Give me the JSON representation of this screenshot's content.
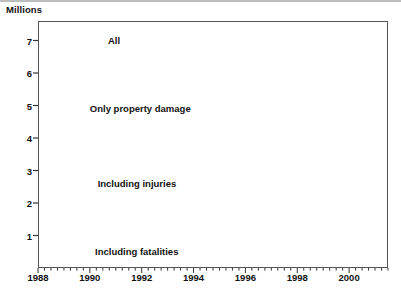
{
  "figure": {
    "units_label": "Millions"
  },
  "chart_data": {
    "type": "line",
    "title": "",
    "subtitle": "",
    "xlabel": "",
    "ylabel": "Millions",
    "ylim": [
      0,
      7.6
    ],
    "xlim": [
      1988,
      2001.5
    ],
    "grid": false,
    "legend_position": "inline-annotations",
    "y_ticks": [
      1,
      2,
      3,
      4,
      5,
      6,
      7
    ],
    "y_tick_labels": [
      "1",
      "2",
      "3",
      "4",
      "5",
      "6",
      "7"
    ],
    "x_ticks": [
      1988,
      1990,
      1992,
      1994,
      1996,
      1998,
      2000
    ],
    "x_tick_labels": [
      "1988",
      "1990",
      "1992",
      "1994",
      "1996",
      "1998",
      "2000"
    ],
    "x_minor_tick_interval": 0.25,
    "x": [
      1988,
      1989,
      1990,
      1991,
      1992,
      1993,
      1994,
      1995,
      1996,
      1997,
      1998,
      1999,
      2000,
      2001
    ],
    "series": [
      {
        "name": "All",
        "label": "All",
        "style": "solid",
        "color": "#1a1a1a",
        "values": [
          6.89,
          6.66,
          6.47,
          6.12,
          6.0,
          6.11,
          6.5,
          6.7,
          6.77,
          6.62,
          6.33,
          6.28,
          6.39,
          6.32
        ]
      },
      {
        "name": "Only property damage",
        "label": "Only property damage",
        "style": "dashed",
        "color": "#1a1a1a",
        "values": [
          4.6,
          4.45,
          4.3,
          4.08,
          4.0,
          4.07,
          4.32,
          4.44,
          4.49,
          4.42,
          4.27,
          4.23,
          4.31,
          4.28
        ]
      },
      {
        "name": "Including injuries",
        "label": "Including injuries",
        "style": "dashed",
        "color": "#1a1a1a",
        "values": [
          2.25,
          2.17,
          2.12,
          2.05,
          2.0,
          2.02,
          2.12,
          2.21,
          2.25,
          2.18,
          2.06,
          2.02,
          2.07,
          1.99
        ]
      },
      {
        "name": "Including fatalities",
        "label": "Including fatalities",
        "style": "dotted",
        "color": "#1a1a1a",
        "values": [
          0.04,
          0.04,
          0.04,
          0.04,
          0.04,
          0.04,
          0.04,
          0.04,
          0.04,
          0.04,
          0.04,
          0.04,
          0.04,
          0.04
        ]
      }
    ],
    "annotations": [
      {
        "text": "All",
        "x": 1990.7,
        "y": 6.95
      },
      {
        "text": "Only property damage",
        "x": 1990.0,
        "y": 4.85
      },
      {
        "text": "Including injuries",
        "x": 1990.3,
        "y": 2.55
      },
      {
        "text": "Including fatalities",
        "x": 1990.2,
        "y": 0.45
      }
    ]
  }
}
